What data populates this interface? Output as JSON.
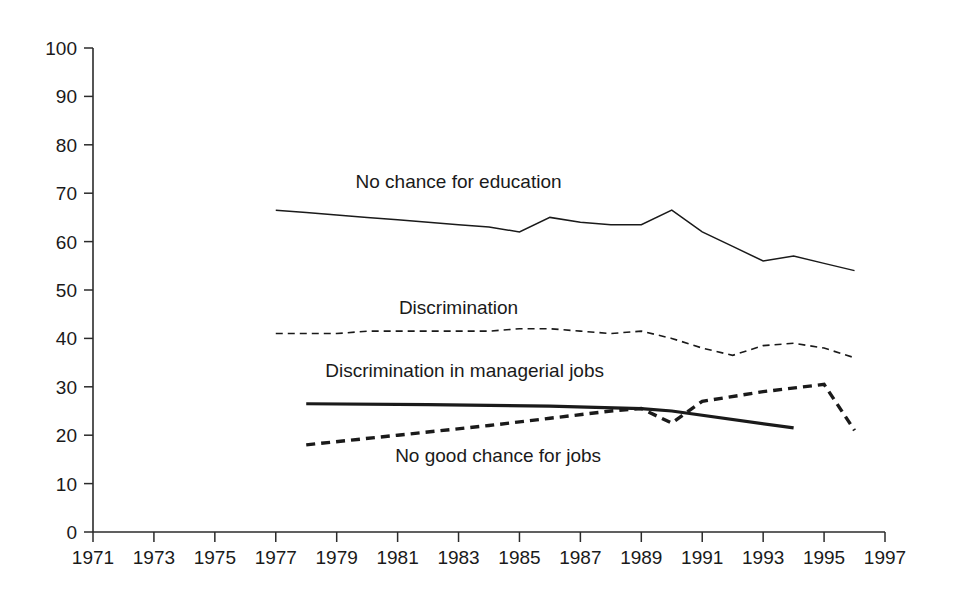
{
  "chart_data": {
    "type": "line",
    "title": "",
    "subtitle": "",
    "xlabel": "",
    "ylabel": "",
    "xlim": [
      1971,
      1997
    ],
    "ylim": [
      0,
      100
    ],
    "grid": false,
    "legend_position": "inline-annotations",
    "x_ticks": [
      1971,
      1973,
      1975,
      1977,
      1979,
      1981,
      1983,
      1985,
      1987,
      1989,
      1991,
      1993,
      1995,
      1997
    ],
    "x_tick_labels": [
      "1971",
      "1973",
      "1975",
      "1977",
      "1979",
      "1981",
      "1983",
      "1985",
      "1987",
      "1989",
      "1991",
      "1993",
      "1995",
      "1997"
    ],
    "y_ticks": [
      0,
      10,
      20,
      30,
      40,
      50,
      60,
      70,
      80,
      90,
      100
    ],
    "y_tick_labels": [
      "0",
      "10",
      "20",
      "30",
      "40",
      "50",
      "60",
      "70",
      "80",
      "90",
      "100"
    ],
    "series": [
      {
        "name": "No chance for education",
        "style": "solid-thin",
        "stroke_width": 1.5,
        "dash": "none",
        "color": "#1a1a1a",
        "x": [
          1977,
          1978,
          1979,
          1980,
          1981,
          1982,
          1983,
          1984,
          1985,
          1986,
          1987,
          1988,
          1989,
          1990,
          1991,
          1992,
          1993,
          1994,
          1995,
          1996
        ],
        "values": [
          66.5,
          66,
          65.5,
          65,
          64.5,
          64,
          63.5,
          63,
          62,
          65,
          64,
          63.5,
          63.5,
          66.5,
          62,
          59,
          56,
          57,
          55.5,
          54
        ],
        "label_x": 1983,
        "label_y": 71,
        "label": "No chance for education"
      },
      {
        "name": "Discrimination",
        "style": "dashed-thin",
        "stroke_width": 1.6,
        "dash": "7,5",
        "color": "#1a1a1a",
        "x": [
          1977,
          1978,
          1979,
          1980,
          1981,
          1982,
          1983,
          1984,
          1985,
          1986,
          1987,
          1988,
          1989,
          1990,
          1991,
          1992,
          1993,
          1994,
          1995,
          1996
        ],
        "values": [
          41,
          41,
          41,
          41.5,
          41.5,
          41.5,
          41.5,
          41.5,
          42,
          42,
          41.5,
          41,
          41.5,
          40,
          38,
          36.5,
          38.5,
          39,
          38,
          36
        ],
        "label_x": 1983,
        "label_y": 45,
        "label": "Discrimination"
      },
      {
        "name": "Discrimination in managerial jobs",
        "style": "solid-thick",
        "stroke_width": 3.2,
        "dash": "none",
        "color": "#1a1a1a",
        "x": [
          1978,
          1982,
          1986,
          1989,
          1990,
          1994
        ],
        "values": [
          26.5,
          26.3,
          26,
          25.5,
          25,
          21.5
        ],
        "label_x": 1983.2,
        "label_y": 32,
        "label": "Discrimination in managerial jobs"
      },
      {
        "name": "No good chance for jobs",
        "style": "dashed-thick",
        "stroke_width": 3.4,
        "dash": "9,6",
        "color": "#1a1a1a",
        "x": [
          1978,
          1981,
          1984,
          1986,
          1988,
          1989,
          1990,
          1991,
          1993,
          1995,
          1996
        ],
        "values": [
          18,
          20,
          22,
          23.5,
          25,
          25.5,
          22.5,
          27,
          29,
          30.5,
          21
        ],
        "label_x": 1984.3,
        "label_y": 14.5,
        "label": "No good chance for jobs"
      }
    ]
  },
  "annotations": {
    "education_label": "No chance for education",
    "discrimination_label": "Discrimination",
    "managerial_label": "Discrimination in managerial jobs",
    "jobs_label": "No good chance for jobs"
  },
  "colors": {
    "background": "#ffffff",
    "ink": "#1a1a1a",
    "axis": "#2b2b2b"
  }
}
